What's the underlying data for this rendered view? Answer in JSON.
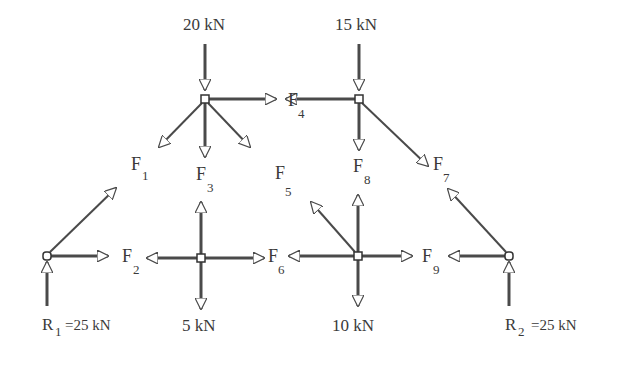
{
  "diagram": {
    "loads": {
      "top_left": "20 kN",
      "top_right": "15 kN",
      "bottom_mid_left": "5 kN",
      "bottom_mid_right": "10 kN"
    },
    "reactions": {
      "r1": {
        "symbol": "R",
        "sub": "1",
        "value": "=25 kN"
      },
      "r2": {
        "symbol": "R",
        "sub": "2",
        "value": "=25 kN"
      }
    },
    "members": [
      {
        "id": "F1",
        "symbol": "F",
        "sub": "1"
      },
      {
        "id": "F2",
        "symbol": "F",
        "sub": "2"
      },
      {
        "id": "F3",
        "symbol": "F",
        "sub": "3"
      },
      {
        "id": "F4",
        "symbol": "F",
        "sub": "4"
      },
      {
        "id": "F5",
        "symbol": "F",
        "sub": "5"
      },
      {
        "id": "F6",
        "symbol": "F",
        "sub": "6"
      },
      {
        "id": "F7",
        "symbol": "F",
        "sub": "7"
      },
      {
        "id": "F8",
        "symbol": "F",
        "sub": "8"
      },
      {
        "id": "F9",
        "symbol": "F",
        "sub": "9"
      }
    ],
    "colors": {
      "line": "#4a4a4a",
      "text": "#3a3a3a",
      "background": "#ffffff"
    }
  }
}
